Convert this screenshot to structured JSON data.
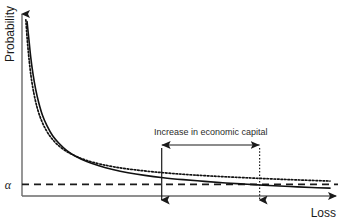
{
  "figure": {
    "background_color": "#ffffff",
    "line_color": "#1a1a1a",
    "axis_color": "#555555"
  },
  "axes": {
    "y_label": "Probability",
    "x_label": "Loss",
    "y_tick_label": "α"
  },
  "annotation": {
    "text": "Increase in economic capital",
    "arrow_name": "double-headed-arrow"
  },
  "chart_data": {
    "type": "line",
    "title": "",
    "xlabel": "Loss",
    "ylabel": "Probability",
    "xlim": [
      0,
      100
    ],
    "ylim": [
      0,
      100
    ],
    "grid": false,
    "legend": null,
    "threshold": {
      "label": "α",
      "y_value": 6.5,
      "style": "dashed",
      "x_from": 0,
      "x_to": 100
    },
    "series": [
      {
        "name": "base-loss-distribution",
        "style": "solid",
        "points": [
          [
            1.0,
            98.0
          ],
          [
            1.6,
            88.0
          ],
          [
            2.2,
            78.0
          ],
          [
            2.9,
            69.0
          ],
          [
            3.8,
            60.0
          ],
          [
            4.8,
            52.5
          ],
          [
            6.0,
            45.5
          ],
          [
            7.5,
            39.5
          ],
          [
            9.3,
            34.0
          ],
          [
            11.5,
            29.5
          ],
          [
            14.0,
            25.5
          ],
          [
            17.0,
            22.2
          ],
          [
            20.5,
            19.4
          ],
          [
            24.5,
            17.0
          ],
          [
            29.0,
            14.9
          ],
          [
            34.0,
            13.1
          ],
          [
            39.5,
            11.6
          ],
          [
            45.5,
            10.3
          ],
          [
            52.0,
            9.2
          ],
          [
            59.0,
            8.2
          ],
          [
            66.0,
            7.3
          ],
          [
            73.0,
            6.6
          ],
          [
            80.0,
            5.9
          ],
          [
            87.0,
            5.3
          ],
          [
            94.0,
            4.8
          ],
          [
            100.0,
            4.4
          ]
        ]
      },
      {
        "name": "fat-tail-loss-distribution",
        "style": "dotted",
        "points": [
          [
            0.6,
            99.0
          ],
          [
            1.1,
            87.0
          ],
          [
            1.7,
            76.0
          ],
          [
            2.4,
            66.0
          ],
          [
            3.3,
            57.0
          ],
          [
            4.4,
            49.0
          ],
          [
            5.7,
            42.5
          ],
          [
            7.3,
            36.8
          ],
          [
            9.2,
            32.0
          ],
          [
            11.5,
            28.0
          ],
          [
            14.2,
            24.7
          ],
          [
            17.4,
            22.0
          ],
          [
            21.0,
            19.7
          ],
          [
            25.2,
            17.8
          ],
          [
            30.0,
            16.2
          ],
          [
            35.4,
            14.9
          ],
          [
            41.5,
            13.7
          ],
          [
            48.2,
            12.7
          ],
          [
            55.5,
            11.8
          ],
          [
            63.5,
            11.0
          ],
          [
            72.0,
            10.3
          ],
          [
            81.0,
            9.6
          ],
          [
            90.0,
            9.0
          ],
          [
            100.0,
            8.4
          ]
        ]
      }
    ],
    "markers": [
      {
        "name": "economic-capital-lower-bound",
        "x_value": 45.0,
        "style": "solid-vertical-arrow"
      },
      {
        "name": "economic-capital-upper-bound",
        "x_value": 77.0,
        "style": "dotted-vertical-arrow"
      }
    ]
  }
}
